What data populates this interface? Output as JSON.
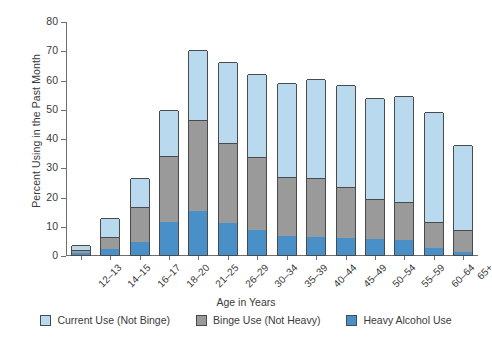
{
  "chart_data": {
    "type": "bar",
    "subtype": "stacked-vertical",
    "title": "",
    "xlabel": "Age in Years",
    "ylabel": "Percent Using in the Past Month",
    "ylim": [
      0,
      80
    ],
    "yticks": [
      0,
      10,
      20,
      30,
      40,
      50,
      60,
      70,
      80
    ],
    "grid": false,
    "legend_position": "bottom",
    "categories": [
      "12–13",
      "14–15",
      "16–17",
      "18–20",
      "21–25",
      "26–29",
      "30–34",
      "35–39",
      "40–44",
      "45–49",
      "50–54",
      "55–59",
      "60–64",
      "65+"
    ],
    "series": [
      {
        "name": "Heavy Alcohol Use",
        "color": "#4a90c8",
        "values": [
          0.7,
          2.0,
          4.4,
          11.2,
          15.1,
          11.1,
          8.6,
          6.5,
          6.2,
          5.7,
          5.6,
          5.1,
          2.5,
          1.1
        ]
      },
      {
        "name": "Binge Use (Not Heavy)",
        "color": "#9a9a9a",
        "values": [
          1.1,
          4.0,
          12.1,
          22.8,
          30.9,
          27.2,
          24.8,
          20.1,
          20.0,
          17.6,
          13.7,
          13.0,
          8.7,
          7.3
        ]
      },
      {
        "name": "Current Use (Not Binge)",
        "color": "#b9d9ee",
        "values": [
          1.5,
          6.5,
          9.8,
          15.5,
          24.0,
          27.7,
          28.6,
          32.1,
          34.1,
          34.7,
          34.4,
          36.3,
          37.7,
          29.3
        ]
      }
    ],
    "totals": [
      3.3,
      12.5,
      26.3,
      49.5,
      70.0,
      66.0,
      62.0,
      58.7,
      60.3,
      58.0,
      53.7,
      54.4,
      48.9,
      37.7
    ]
  },
  "legend": {
    "entries": [
      {
        "label": "Current Use (Not Binge)",
        "color": "#b9d9ee"
      },
      {
        "label": "Binge Use (Not Heavy)",
        "color": "#9a9a9a"
      },
      {
        "label": "Heavy Alcohol Use",
        "color": "#4a90c8"
      }
    ]
  },
  "axes": {
    "y_title": "Percent Using in the Past Month",
    "x_title": "Age in Years",
    "y_tick_labels": [
      "0",
      "10",
      "20",
      "30",
      "40",
      "50",
      "60",
      "70",
      "80"
    ],
    "x_tick_labels": [
      "12–13",
      "14–15",
      "16–17",
      "18–20",
      "21–25",
      "26–29",
      "30–34",
      "35–39",
      "40–44",
      "45–49",
      "50–54",
      "55–59",
      "60–64",
      "65+"
    ]
  },
  "colors": {
    "current_use": "#b9d9ee",
    "binge_use": "#9a9a9a",
    "heavy_use": "#4a90c8",
    "axis": "#6e6e6e",
    "bar_outline": "#4a4a4a",
    "background": "#ffffff"
  }
}
